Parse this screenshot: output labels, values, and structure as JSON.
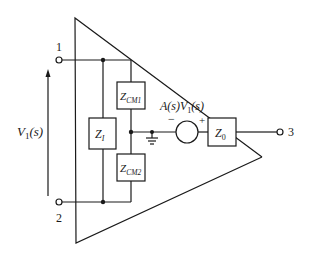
{
  "diagram": {
    "terminals": [
      {
        "id": "1",
        "label": "1"
      },
      {
        "id": "2",
        "label": "2"
      },
      {
        "id": "3",
        "label": "3"
      }
    ],
    "input_voltage": {
      "label_main": "V",
      "label_sub": "1",
      "label_arg": "(s)"
    },
    "components": {
      "z_i": {
        "main": "Z",
        "sub": "I"
      },
      "z_cm1": {
        "main": "Z",
        "sub": "CM1"
      },
      "z_cm2": {
        "main": "Z",
        "sub": "CM2"
      },
      "z_0": {
        "main": "Z",
        "sub": "0"
      }
    },
    "source": {
      "label_a": "A(s)",
      "label_v": "V",
      "label_sub": "1",
      "label_arg": "(s)",
      "minus": "−",
      "plus": "+"
    },
    "ground": {
      "name": "ground"
    },
    "colors": {
      "line": "#1a1a1a",
      "background": "#ffffff"
    }
  }
}
